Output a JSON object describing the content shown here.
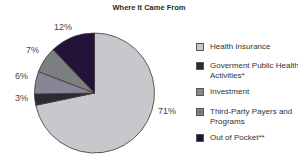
{
  "chart_data": {
    "type": "pie",
    "title": "Where It Came From",
    "categories": [
      "Health Insurance",
      "Goverment Public Health Activities*",
      "Investment",
      "Third-Party Payers and Programs",
      "Out of Pocket**"
    ],
    "values": [
      71,
      3,
      6,
      7,
      12
    ],
    "unit": "%",
    "colors": [
      "#c8c7cc",
      "#2b2a2e",
      "#8a8596",
      "#7d7e7f",
      "#241339"
    ],
    "legend_position": "right",
    "labels": [
      "71%",
      "3%",
      "6%",
      "7%",
      "12%"
    ]
  },
  "title": "Where It Came From",
  "slice_labels": {
    "health_insurance": "71%",
    "government": "3%",
    "investment": "6%",
    "third_party": "7%",
    "out_of_pocket": "12%"
  },
  "legend": {
    "items": [
      {
        "label": "Health Insurance",
        "color": "#c8c7cc"
      },
      {
        "label": "Goverment Public Health Activities*",
        "color": "#2b2a2e"
      },
      {
        "label": "Investment",
        "color": "#8a8596"
      },
      {
        "label": "Third-Party Payers and Programs",
        "color": "#7d7e7f"
      },
      {
        "label": "Out of Pocket**",
        "color": "#241339"
      }
    ]
  }
}
